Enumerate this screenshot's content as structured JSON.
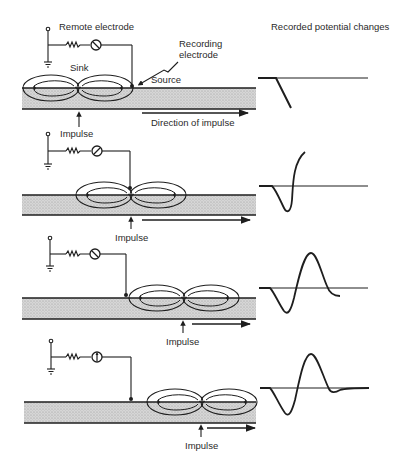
{
  "labels": {
    "remote_electrode": "Remote electrode",
    "recording_electrode_line1": "Recording",
    "recording_electrode_line2": "electrode",
    "sink": "Sink",
    "source": "Source",
    "direction_of_impulse": "Direction of impulse",
    "recorded_potential_changes": "Recorded potential changes",
    "impulse": "Impulse"
  },
  "panels": [
    {
      "id": 1,
      "fiber_top": 88,
      "electrode_x": 131,
      "dipole_center": 78,
      "impulse_label": "Impulse",
      "meter_glyph": "needle-left"
    },
    {
      "id": 2,
      "fiber_top": 195,
      "electrode_x": 131,
      "dipole_center": 131,
      "impulse_label": "Impulse",
      "meter_glyph": "needle-right"
    },
    {
      "id": 3,
      "fiber_top": 298,
      "electrode_x": 126,
      "dipole_center": 184,
      "impulse_label": "Impulse",
      "meter_glyph": "needle-left"
    },
    {
      "id": 4,
      "fiber_top": 402,
      "electrode_x": 130,
      "dipole_center": 202,
      "impulse_label": "Impulse",
      "meter_glyph": "needle-up"
    }
  ],
  "colors": {
    "ink": "#1e1e1e",
    "fiber_fill": "#cfcfcf",
    "background": "#ffffff"
  }
}
